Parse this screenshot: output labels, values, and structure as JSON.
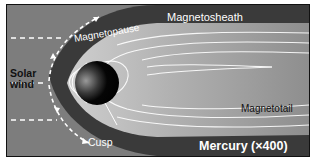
{
  "diagram": {
    "labels": {
      "magnetosheath": "Magnetosheath",
      "magnetopause": "Magnetopause",
      "solar_wind_line1": "Solar",
      "solar_wind_line2": "wind",
      "magnetotail": "Magnetotail",
      "cusp": "Cusp",
      "title": "Mercury (×400)"
    },
    "colors": {
      "solar_wind_region": "#7d7d7d",
      "magnetosheath": "#3a3a3a",
      "magnetosphere": "#a9a9a9",
      "planet": "#0a0a0a",
      "field_lines": "#ffffff",
      "frame_border": "#111111"
    },
    "elements": [
      {
        "name": "planet",
        "shape": "circle"
      },
      {
        "name": "bow-shock-arrows",
        "style": "dashed white arrows"
      },
      {
        "name": "solar-wind-dashed-lines",
        "count": 3
      },
      {
        "name": "magnetic-field-lines",
        "style": "white curves"
      }
    ]
  }
}
